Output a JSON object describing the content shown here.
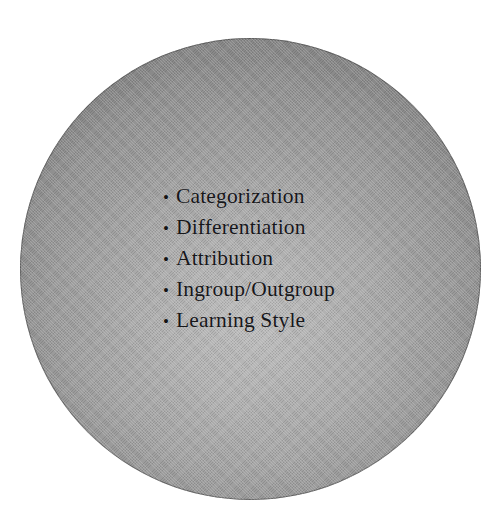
{
  "slide": {
    "background_color": "#ffffff",
    "shape": {
      "name": "circle",
      "fill_start_color": "#bcbcbc",
      "fill_end_color": "#8b8b8b",
      "outline_color": "#4a4a4a"
    },
    "bullet_glyph": "•",
    "text_color": "#17171a",
    "items": [
      {
        "label": "Categorization"
      },
      {
        "label": "Differentiation"
      },
      {
        "label": "Attribution"
      },
      {
        "label": "Ingroup/Outgroup"
      },
      {
        "label": "Learning Style"
      }
    ]
  }
}
